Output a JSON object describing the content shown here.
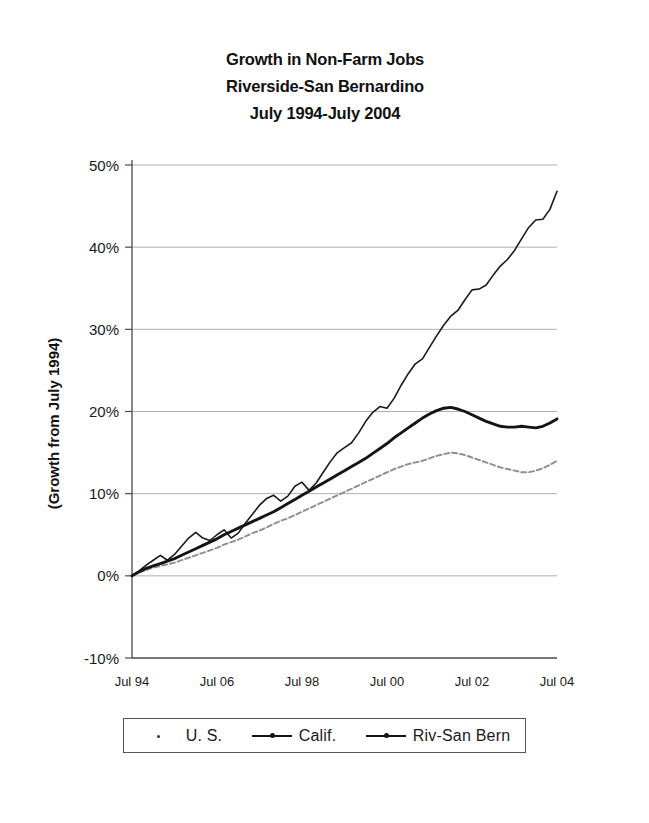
{
  "chart_data": {
    "type": "line",
    "title": "Growth in Non-Farm Jobs",
    "subtitle": "Riverside-San Bernardino",
    "subtitle2": "July 1994-July 2004",
    "title_lines": [
      "Growth in Non-Farm Jobs",
      "Riverside-San Bernardino",
      "July 1994-July 2004"
    ],
    "xlabel": "",
    "ylabel": "(Growth from July 1994)",
    "ylim": [
      -10,
      50
    ],
    "yticks": [
      50,
      40,
      30,
      20,
      10,
      0,
      -10
    ],
    "ytick_labels": [
      "50%",
      "40%",
      "30%",
      "20%",
      "10%",
      "0%",
      "-10%"
    ],
    "xlim": [
      0,
      120
    ],
    "xticks": [
      0,
      24,
      48,
      72,
      96,
      120
    ],
    "xtick_labels": [
      "Jul 94",
      "Jul 06",
      "Jul 98",
      "Jul 00",
      "Jul 02",
      "Jul 04"
    ],
    "grid": true,
    "grid_axis": "y",
    "legend_position": "below-axes",
    "units": "percent growth from July 1994",
    "x_units": "months since July 1994",
    "series": [
      {
        "name": "U. S.",
        "marker": "dot",
        "style": "dotted-light",
        "color": "#8d8d8d",
        "x": [
          0,
          2,
          4,
          6,
          8,
          10,
          12,
          14,
          16,
          18,
          20,
          22,
          24,
          26,
          28,
          30,
          32,
          34,
          36,
          38,
          40,
          42,
          44,
          46,
          48,
          50,
          52,
          54,
          56,
          58,
          60,
          62,
          64,
          66,
          68,
          70,
          72,
          74,
          76,
          78,
          80,
          82,
          84,
          86,
          88,
          90,
          92,
          94,
          96,
          98,
          100,
          102,
          104,
          106,
          108,
          110,
          112,
          114,
          116,
          118,
          120
        ],
        "values": [
          0.0,
          0.4,
          0.7,
          1.0,
          1.2,
          1.4,
          1.6,
          1.9,
          2.2,
          2.5,
          2.8,
          3.1,
          3.4,
          3.8,
          4.1,
          4.4,
          4.8,
          5.2,
          5.5,
          5.9,
          6.3,
          6.7,
          7.0,
          7.4,
          7.8,
          8.2,
          8.6,
          9.0,
          9.4,
          9.8,
          10.2,
          10.6,
          11.0,
          11.4,
          11.8,
          12.2,
          12.6,
          13.0,
          13.3,
          13.6,
          13.8,
          14.0,
          14.3,
          14.6,
          14.8,
          15.0,
          14.9,
          14.7,
          14.4,
          14.1,
          13.8,
          13.5,
          13.2,
          13.0,
          12.8,
          12.6,
          12.6,
          12.8,
          13.1,
          13.5,
          14.0
        ]
      },
      {
        "name": "Calif.",
        "marker": "dot",
        "style": "solid-thick",
        "color": "#141414",
        "x": [
          0,
          2,
          4,
          6,
          8,
          10,
          12,
          14,
          16,
          18,
          20,
          22,
          24,
          26,
          28,
          30,
          32,
          34,
          36,
          38,
          40,
          42,
          44,
          46,
          48,
          50,
          52,
          54,
          56,
          58,
          60,
          62,
          64,
          66,
          68,
          70,
          72,
          74,
          76,
          78,
          80,
          82,
          84,
          86,
          88,
          90,
          92,
          94,
          96,
          98,
          100,
          102,
          104,
          106,
          108,
          110,
          112,
          114,
          116,
          118,
          120
        ],
        "values": [
          0.0,
          0.5,
          0.9,
          1.2,
          1.5,
          1.8,
          2.1,
          2.5,
          2.9,
          3.3,
          3.7,
          4.1,
          4.5,
          5.0,
          5.4,
          5.8,
          6.2,
          6.6,
          7.0,
          7.4,
          7.8,
          8.3,
          8.8,
          9.3,
          9.8,
          10.3,
          10.8,
          11.3,
          11.8,
          12.3,
          12.8,
          13.3,
          13.8,
          14.3,
          14.9,
          15.5,
          16.1,
          16.8,
          17.4,
          18.0,
          18.6,
          19.2,
          19.7,
          20.1,
          20.4,
          20.5,
          20.3,
          20.0,
          19.6,
          19.2,
          18.8,
          18.5,
          18.2,
          18.1,
          18.1,
          18.2,
          18.1,
          18.0,
          18.2,
          18.6,
          19.1
        ]
      },
      {
        "name": "Riv-San Bern",
        "marker": "dot",
        "style": "solid-thin-seasonal",
        "color": "#1a1a1a",
        "x": [
          0,
          2,
          4,
          6,
          8,
          10,
          12,
          14,
          16,
          18,
          20,
          22,
          24,
          26,
          28,
          30,
          32,
          34,
          36,
          38,
          40,
          42,
          44,
          46,
          48,
          50,
          52,
          54,
          56,
          58,
          60,
          62,
          64,
          66,
          68,
          70,
          72,
          74,
          76,
          78,
          80,
          82,
          84,
          86,
          88,
          90,
          92,
          94,
          96,
          98,
          100,
          102,
          104,
          106,
          108,
          110,
          112,
          114,
          116,
          118,
          120
        ],
        "values": [
          0.0,
          0.6,
          1.3,
          1.9,
          2.5,
          1.9,
          2.6,
          3.6,
          4.6,
          5.3,
          4.6,
          4.3,
          5.0,
          5.6,
          4.6,
          5.2,
          6.4,
          7.5,
          8.6,
          9.4,
          9.8,
          9.1,
          9.7,
          10.9,
          11.4,
          10.4,
          11.3,
          12.6,
          13.9,
          15.0,
          15.6,
          16.2,
          17.4,
          18.8,
          19.9,
          20.6,
          20.4,
          21.6,
          23.2,
          24.6,
          25.8,
          26.4,
          27.8,
          29.2,
          30.5,
          31.6,
          32.3,
          33.6,
          34.8,
          34.9,
          35.4,
          36.6,
          37.7,
          38.5,
          39.6,
          41.0,
          42.4,
          43.3,
          43.4,
          44.6,
          46.8
        ]
      }
    ],
    "annotations": {
      "riv_san_bern_end_value": 47,
      "calif_peak_value": 20.5,
      "us_peak_value": 15,
      "calif_end_value": 19,
      "us_end_value": 14
    }
  },
  "legend": {
    "items": [
      {
        "label": "U. S.",
        "marker": "dot-marker"
      },
      {
        "label": "Calif.",
        "marker": "line-dot-marker"
      },
      {
        "label": "Riv-San Bern",
        "marker": "line-dot-marker"
      }
    ]
  }
}
